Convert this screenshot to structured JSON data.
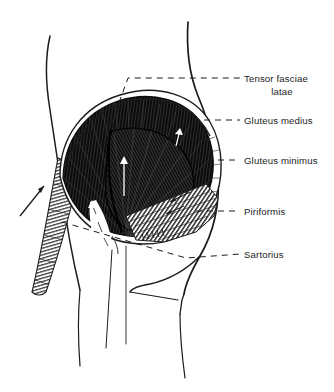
{
  "figure": {
    "background_color": "#ffffff",
    "ink_color": "#1c1c1c",
    "muscle_fill_color": "#111111",
    "width": 334,
    "height": 392
  },
  "labels": [
    {
      "id": "tensor-fasciae-latae",
      "line1": "Tensor fasciae",
      "line2": "latae",
      "leader_y": 78,
      "text_x": 244,
      "text_y": 82
    },
    {
      "id": "gluteus-medius",
      "line1": "Gluteus medius",
      "line2": "",
      "leader_y": 120,
      "text_x": 244,
      "text_y": 124
    },
    {
      "id": "gluteus-minimus",
      "line1": "Gluteus minimus",
      "line2": "",
      "leader_y": 160,
      "text_x": 244,
      "text_y": 164
    },
    {
      "id": "piriformis",
      "line1": "Piriformis",
      "line2": "",
      "leader_y": 211,
      "text_x": 244,
      "text_y": 215
    },
    {
      "id": "sartorius",
      "line1": "Sartorius",
      "line2": "",
      "leader_y": 254,
      "text_x": 244,
      "text_y": 258
    }
  ],
  "structures": [
    {
      "id": "torso-outline-left",
      "name": "left flank contour"
    },
    {
      "id": "torso-outline-right",
      "name": "right hip and buttock contour"
    },
    {
      "id": "gluteus-medius-mass",
      "name": "gluteus medius fan"
    },
    {
      "id": "gluteus-minimus-mass",
      "name": "gluteus minimus deep fan"
    },
    {
      "id": "tensor-fasciae-latae-band",
      "name": "tensor fasciae latae band"
    },
    {
      "id": "piriformis-wedge",
      "name": "piriformis striated wedge"
    },
    {
      "id": "sartorius-band",
      "name": "sartorius hatched band"
    },
    {
      "id": "gluteal-fold",
      "name": "gluteal fold"
    },
    {
      "id": "thigh-outline",
      "name": "thigh contour"
    }
  ]
}
